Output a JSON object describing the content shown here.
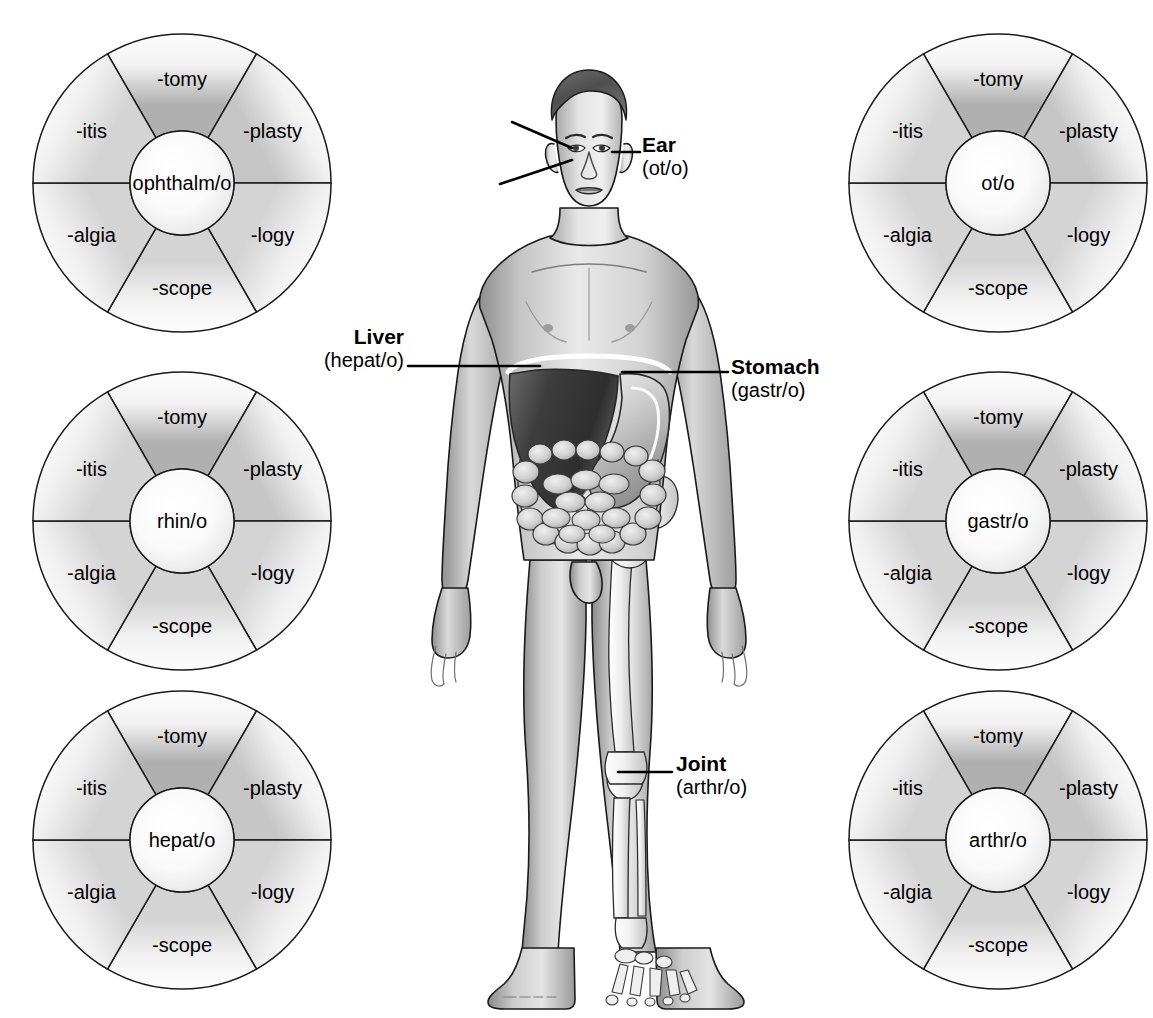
{
  "figure": {
    "type": "medical-terminology-wheels"
  },
  "suffixes": [
    "-tomy",
    "-plasty",
    "-logy",
    "-scope",
    "-algia",
    "-itis"
  ],
  "wheels": [
    {
      "id": "wheel-ophthalmo",
      "root": "ophthalm/o",
      "position": "top-left",
      "cx": 32,
      "cy": 33,
      "segments": [
        "-tomy",
        "-plasty",
        "-logy",
        "-scope",
        "-algia",
        "-itis"
      ]
    },
    {
      "id": "wheel-rhino",
      "root": "rhin/o",
      "position": "middle-left",
      "cx": 32,
      "cy": 371,
      "segments": [
        "-tomy",
        "-plasty",
        "-logy",
        "-scope",
        "-algia",
        "-itis"
      ]
    },
    {
      "id": "wheel-hepato",
      "root": "hepat/o",
      "position": "bottom-left",
      "cx": 32,
      "cy": 690,
      "segments": [
        "-tomy",
        "-plasty",
        "-logy",
        "-scope",
        "-algia",
        "-itis"
      ]
    },
    {
      "id": "wheel-oto",
      "root": "ot/o",
      "position": "top-right",
      "cx": 848,
      "cy": 33,
      "segments": [
        "-tomy",
        "-plasty",
        "-logy",
        "-scope",
        "-algia",
        "-itis"
      ]
    },
    {
      "id": "wheel-gastro",
      "root": "gastr/o",
      "position": "middle-right",
      "cx": 848,
      "cy": 371,
      "segments": [
        "-tomy",
        "-plasty",
        "-logy",
        "-scope",
        "-algia",
        "-itis"
      ]
    },
    {
      "id": "wheel-arthro",
      "root": "arthr/o",
      "position": "bottom-right",
      "cx": 848,
      "cy": 690,
      "segments": [
        "-tomy",
        "-plasty",
        "-logy",
        "-scope",
        "-algia",
        "-itis"
      ]
    }
  ],
  "callouts": [
    {
      "id": "callout-eye",
      "term": "Eye",
      "root": "(ophthalm/o)",
      "align": "right",
      "x": 250,
      "y": 78
    },
    {
      "id": "callout-nose",
      "term": "Nose",
      "root": "(rhin/o)",
      "align": "right",
      "x": 250,
      "y": 140
    },
    {
      "id": "callout-ear",
      "term": "Ear",
      "root": "(ot/o)",
      "align": "left",
      "x": 640,
      "y": 133
    },
    {
      "id": "callout-liver",
      "term": "Liver",
      "root": "(hepat/o)",
      "align": "right",
      "x": 150,
      "y": 325
    },
    {
      "id": "callout-stomach",
      "term": "Stomach",
      "root": "(gastr/o)",
      "align": "left",
      "x": 731,
      "y": 355
    },
    {
      "id": "callout-joint",
      "term": "Joint",
      "root": "(arthr/o)",
      "align": "left",
      "x": 676,
      "y": 752
    }
  ],
  "colors": {
    "outline": "#1a1a1a",
    "background": "#ffffff",
    "segment_light": "#fbfbfb",
    "segment_dark": "#b9b9b9",
    "hub_fill": "#fdfdfd",
    "skin_light": "#e6e6e6",
    "skin_mid": "#b4b4b4",
    "skin_dark": "#8c8c8c",
    "hair": "#5a5a5a",
    "liver": "#4a4a4a",
    "stomach": "#cfcfcf",
    "bone": "#f2f2f2",
    "intestine": "#d8d8d8"
  }
}
